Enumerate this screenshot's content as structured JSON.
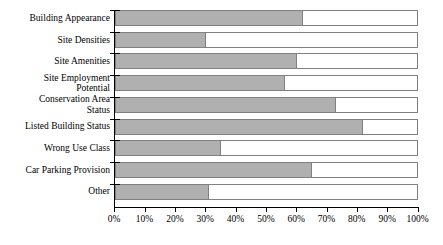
{
  "chart_data": {
    "type": "bar",
    "orientation": "horizontal",
    "title": "",
    "xlabel": "",
    "ylabel": "",
    "xlim": [
      0,
      100
    ],
    "grid": false,
    "legend": null,
    "stacked": true,
    "xticks": [
      "0%",
      "10%",
      "20%",
      "30%",
      "40%",
      "50%",
      "60%",
      "70%",
      "80%",
      "90%",
      "100%"
    ],
    "xtick_values": [
      0,
      10,
      20,
      30,
      40,
      50,
      60,
      70,
      80,
      90,
      100
    ],
    "categories": [
      "Building Appearance",
      "Site Densities",
      "Site Amenities",
      "Site Employment\nPotential",
      "Conservation Area\nStatus",
      "Listed Building Status",
      "Wrong Use Class",
      "Car Parking Provision",
      "Other"
    ],
    "series": [
      {
        "name": "Filled",
        "color": "#b0b0b0",
        "values": [
          62,
          30,
          60,
          56,
          73,
          82,
          35,
          65,
          31
        ]
      },
      {
        "name": "Remainder",
        "color": "#ffffff",
        "values": [
          38,
          70,
          40,
          44,
          27,
          18,
          65,
          35,
          69
        ]
      }
    ]
  },
  "colors": {
    "fill": "#b0b0b0",
    "outline": "#808080",
    "axis": "#000000",
    "background": "#ffffff"
  }
}
